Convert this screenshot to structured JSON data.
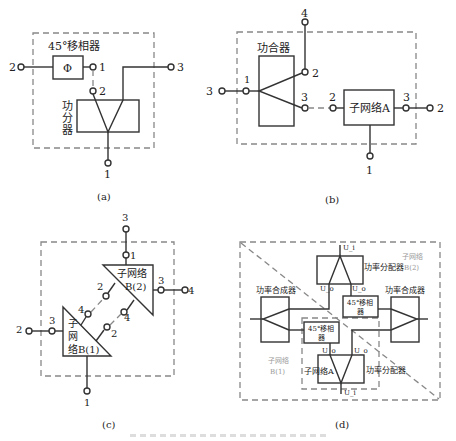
{
  "panels": {
    "a": {
      "caption": "(a)",
      "phase_shifter_label": "45°移相器",
      "phi_symbol": "Φ",
      "divider_label": [
        "功",
        "分",
        "器"
      ],
      "ports": {
        "p2_left": "2",
        "p1_shifter": "1",
        "p2_divider": "2",
        "p3_right": "3",
        "p1_bottom": "1"
      }
    },
    "b": {
      "caption": "(b)",
      "combiner_label": "功合器",
      "subnet_label": "子网络A",
      "ports": {
        "top4": "4",
        "comb2": "2",
        "comb1": "1",
        "left3": "3",
        "comb3": "3",
        "sub2": "2",
        "sub3": "3",
        "right2": "2",
        "bottom1": "1"
      }
    },
    "c": {
      "caption": "(c)",
      "subnet_b2_label": [
        "子网络",
        "B(2)"
      ],
      "subnet_b1_label": [
        "子",
        "网",
        "络B(1)"
      ],
      "ports": {
        "top3": "3",
        "b2_1": "1",
        "b2_3": "3",
        "right4": "4",
        "b2_2": "2",
        "b2_4": "4",
        "b1_4": "4",
        "b1_2": "2",
        "b1_3": "3",
        "left2": "2",
        "bottom1": "1"
      }
    },
    "d": {
      "caption": "(d)",
      "top_divider_label": "功率分配器",
      "bottom_divider_label": "功率分配器",
      "left_combiner_label": "功率合成器",
      "right_combiner_label": "功率合成器",
      "shifter_upper_label": [
        "45°移相",
        "器"
      ],
      "shifter_lower_label": [
        "45°移相",
        "器"
      ],
      "subnet_a_label": "子网络A",
      "subnet_b1_label": [
        "子网络",
        "B(1)"
      ],
      "subnet_b2_label": [
        "子网络",
        "B(2)"
      ],
      "voltages": {
        "top_in": "U_i",
        "top_left": "U_o",
        "top_right": "U_o",
        "bot_left": "U_o",
        "bot_right": "U_o",
        "bot_in": "U_i"
      }
    }
  }
}
